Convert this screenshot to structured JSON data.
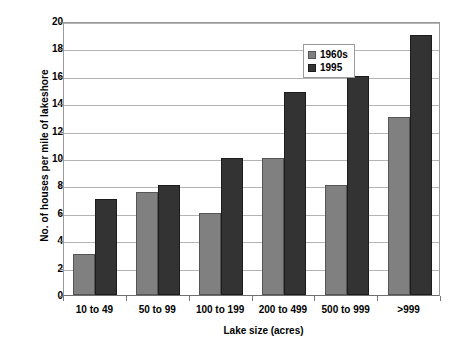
{
  "chart_data": {
    "type": "bar",
    "title": "",
    "xlabel": "Lake size (acres)",
    "ylabel": "No. of houses per mile of lakeshore",
    "categories": [
      "10 to 49",
      "50 to 99",
      "100 to 199",
      "200 to 499",
      "500 to 999",
      ">999"
    ],
    "series": [
      {
        "name": "1960s",
        "color": "#808080",
        "values": [
          3,
          7.5,
          6,
          10,
          8,
          13
        ]
      },
      {
        "name": "1995",
        "color": "#333333",
        "values": [
          7,
          8,
          10,
          14.8,
          16,
          19
        ]
      }
    ],
    "ylim": [
      0,
      20
    ],
    "ytick_step": 2,
    "yticks": [
      0,
      2,
      4,
      6,
      8,
      10,
      12,
      14,
      16,
      18,
      20
    ],
    "ytick_labels": [
      "0",
      "2",
      "4",
      "6",
      "8",
      "10",
      "12",
      "14",
      "16",
      "18",
      "20"
    ],
    "grid": true,
    "grid_axis": "y",
    "legend_position": "top-right",
    "legend_entries": [
      "1960s",
      "1995"
    ]
  }
}
